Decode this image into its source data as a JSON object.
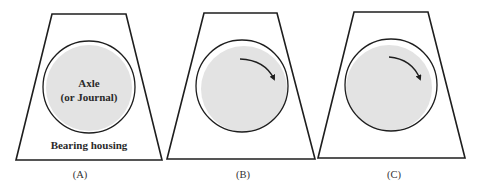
{
  "colors": {
    "outline": "#1e1e1e",
    "axle_fill": "#e3e3e3",
    "background": "#ffffff"
  },
  "panels": [
    {
      "id": "A",
      "caption": "(A)",
      "axle_label_line1": "Axle",
      "axle_label_line2": "(or Journal)",
      "housing_label": "Bearing housing",
      "rotation_arrow": false,
      "axle_position": "centered"
    },
    {
      "id": "B",
      "caption": "(B)",
      "rotation_arrow": true,
      "rotation_direction": "clockwise",
      "axle_position": "shifted lower-right, contacting bearing"
    },
    {
      "id": "C",
      "caption": "(C)",
      "rotation_arrow": true,
      "rotation_direction": "clockwise",
      "axle_position": "shifted lower-left, contacting bearing"
    }
  ]
}
